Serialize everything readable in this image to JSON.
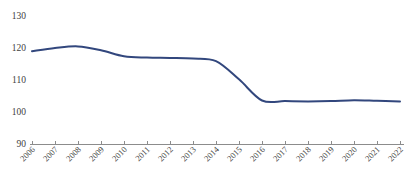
{
  "chart_data": {
    "type": "line",
    "title": "",
    "subtitle": "",
    "xlabel": "",
    "ylabel": "",
    "grid": false,
    "legend": null,
    "legend_position": "none",
    "ylim": [
      90,
      130
    ],
    "ytick_labels": [
      "130",
      "120",
      "110",
      "100",
      "90"
    ],
    "ytick_values": [
      130,
      120,
      110,
      100,
      90
    ],
    "xlim": [
      "2006",
      "2022"
    ],
    "categories": [
      "2006",
      "2007",
      "2008",
      "2009",
      "2010",
      "2011",
      "2012",
      "2013",
      "2014",
      "2015",
      "2016",
      "2017",
      "2018",
      "2019",
      "2020",
      "2021",
      "2022"
    ],
    "series": [
      {
        "name": "index",
        "color": "#32477d",
        "values": [
          119.0,
          120.0,
          120.5,
          119.3,
          117.4,
          117.0,
          116.9,
          116.7,
          115.9,
          110.2,
          103.6,
          103.4,
          103.3,
          103.4,
          103.7,
          103.5,
          103.3
        ]
      }
    ],
    "annotations": []
  },
  "axes": {
    "y_axis_name": "value-axis",
    "x_axis_name": "year-axis"
  }
}
